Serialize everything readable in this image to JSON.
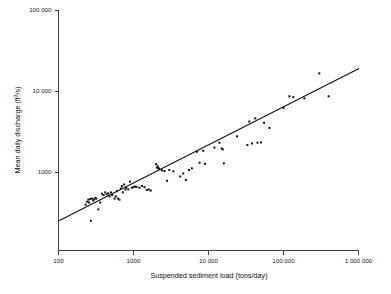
{
  "chart_data": {
    "type": "scatter",
    "title": "",
    "xlabel": "Suspended sediment load  (tons/day)",
    "ylabel": "Mean daily discharge (ft3/s)",
    "ylabel_base": "Mean daily discharge (ft",
    "ylabel_sup": "3",
    "ylabel_tail": "/s)",
    "xscale": "log",
    "yscale": "log",
    "xlim": [
      100,
      1000000
    ],
    "ylim": [
      190,
      100000
    ],
    "grid": false,
    "legend": null,
    "xticks": [
      100,
      1000,
      10000,
      100000,
      1000000
    ],
    "xticklabels": [
      "100",
      "1000",
      "10 000",
      "100 000",
      "1 000 000"
    ],
    "yticks": [
      1000,
      10000,
      100000
    ],
    "yticklabels": [
      "1000",
      "10 000",
      "100 000"
    ],
    "trendline": {
      "label": "regression line",
      "x_start": 100,
      "y_start": 248,
      "x_end": 1000000,
      "y_end": 18800
    },
    "point_color": "#111111",
    "line_color": "#111111",
    "axis_color": "#2b2b2b",
    "n_points": 78,
    "points": [
      [
        230,
        395
      ],
      [
        240,
        430
      ],
      [
        250,
        455
      ],
      [
        255,
        420
      ],
      [
        265,
        465
      ],
      [
        270,
        250
      ],
      [
        280,
        470
      ],
      [
        290,
        445
      ],
      [
        300,
        460
      ],
      [
        310,
        480
      ],
      [
        320,
        470
      ],
      [
        340,
        345
      ],
      [
        360,
        420
      ],
      [
        380,
        540
      ],
      [
        400,
        520
      ],
      [
        420,
        560
      ],
      [
        440,
        530
      ],
      [
        460,
        545
      ],
      [
        480,
        500
      ],
      [
        500,
        560
      ],
      [
        520,
        520
      ],
      [
        560,
        470
      ],
      [
        580,
        500
      ],
      [
        600,
        580
      ],
      [
        620,
        470
      ],
      [
        650,
        455
      ],
      [
        680,
        625
      ],
      [
        700,
        670
      ],
      [
        720,
        560
      ],
      [
        750,
        700
      ],
      [
        780,
        610
      ],
      [
        800,
        640
      ],
      [
        850,
        610
      ],
      [
        900,
        760
      ],
      [
        950,
        640
      ],
      [
        1000,
        650
      ],
      [
        1050,
        660
      ],
      [
        1100,
        655
      ],
      [
        1200,
        640
      ],
      [
        1300,
        670
      ],
      [
        1400,
        650
      ],
      [
        1500,
        600
      ],
      [
        1600,
        610
      ],
      [
        1700,
        590
      ],
      [
        2000,
        1250
      ],
      [
        2050,
        1130
      ],
      [
        2100,
        1180
      ],
      [
        2150,
        1120
      ],
      [
        2200,
        1090
      ],
      [
        2400,
        1050
      ],
      [
        2600,
        1030
      ],
      [
        2800,
        780
      ],
      [
        3000,
        1060
      ],
      [
        3400,
        1020
      ],
      [
        4200,
        880
      ],
      [
        4600,
        960
      ],
      [
        5000,
        800
      ],
      [
        5500,
        1060
      ],
      [
        6000,
        1110
      ],
      [
        7000,
        1780
      ],
      [
        7600,
        1300
      ],
      [
        8500,
        1830
      ],
      [
        9000,
        1260
      ],
      [
        12000,
        2000
      ],
      [
        14000,
        2300
      ],
      [
        15000,
        1950
      ],
      [
        15500,
        1900
      ],
      [
        16000,
        1280
      ],
      [
        24000,
        2750
      ],
      [
        33000,
        2150
      ],
      [
        35000,
        4200
      ],
      [
        38000,
        2250
      ],
      [
        42000,
        4600
      ],
      [
        45000,
        2300
      ],
      [
        50000,
        2320
      ],
      [
        55000,
        4050
      ],
      [
        65000,
        3500
      ],
      [
        100000,
        6200
      ],
      [
        120000,
        8600
      ],
      [
        135000,
        8400
      ],
      [
        190000,
        8100
      ],
      [
        300000,
        16500
      ],
      [
        400000,
        8600
      ]
    ]
  },
  "figure": {
    "background": "#ffffff",
    "width": 391,
    "height": 294
  }
}
